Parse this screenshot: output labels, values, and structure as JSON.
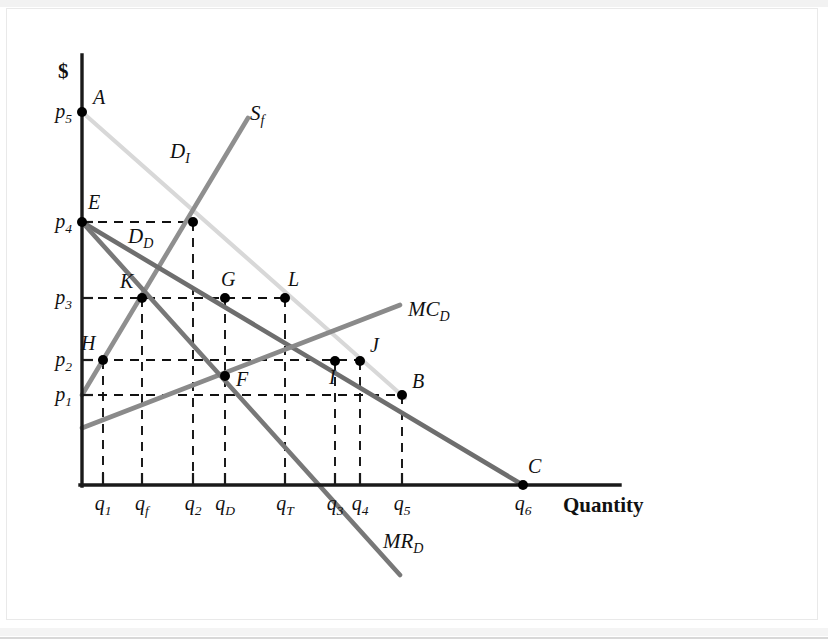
{
  "figure": {
    "title": "",
    "y_axis_label": "$",
    "x_axis_label": "Quantity"
  },
  "chart_data": {
    "type": "line",
    "title": "",
    "xlabel": "Quantity",
    "ylabel": "$",
    "grid": false,
    "legend_position": "inline-curve-labels",
    "axis_ranges": {
      "x_pixel": [
        80,
        620
      ],
      "y_pixel": [
        55,
        485
      ]
    },
    "price_ticks": [
      {
        "name": "p1",
        "label": "p",
        "sub": "1",
        "y": 395
      },
      {
        "name": "p2",
        "label": "p",
        "sub": "2",
        "y": 360
      },
      {
        "name": "p3",
        "label": "p",
        "sub": "3",
        "y": 298
      },
      {
        "name": "p4",
        "label": "p",
        "sub": "4",
        "y": 222
      },
      {
        "name": "p5",
        "label": "p",
        "sub": "5",
        "y": 112
      }
    ],
    "quantity_ticks": [
      {
        "name": "q1",
        "label": "q",
        "sub": "1",
        "x": 103
      },
      {
        "name": "qf",
        "label": "q",
        "sub": "f",
        "x": 142
      },
      {
        "name": "q2",
        "label": "q",
        "sub": "2",
        "x": 193
      },
      {
        "name": "qD",
        "label": "q",
        "sub": "D",
        "x": 225
      },
      {
        "name": "qT",
        "label": "q",
        "sub": "T",
        "x": 285
      },
      {
        "name": "q3",
        "label": "q",
        "sub": "3",
        "x": 335
      },
      {
        "name": "q4",
        "label": "q",
        "sub": "4",
        "x": 360
      },
      {
        "name": "q5",
        "label": "q",
        "sub": "5",
        "x": 402
      },
      {
        "name": "q6",
        "label": "q",
        "sub": "6",
        "x": 523
      }
    ],
    "series": [
      {
        "name": "D_I",
        "label": "D",
        "sublabel": "I",
        "color": "#d8d8d8",
        "description": "Integrated demand curve",
        "points": [
          [
            82,
            112
          ],
          [
            405,
            398
          ]
        ],
        "label_pos": [
          170,
          158
        ]
      },
      {
        "name": "S_f",
        "label": "S",
        "sublabel": "f",
        "color": "#8f8f8f",
        "description": "Fringe supply curve",
        "points": [
          [
            82,
            395
          ],
          [
            248,
            118
          ]
        ],
        "label_pos": [
          250,
          120
        ]
      },
      {
        "name": "D_D",
        "label": "D",
        "sublabel": "D",
        "color": "#6e6e6e",
        "description": "Dominant firm residual demand curve",
        "points": [
          [
            82,
            222
          ],
          [
            523,
            485
          ]
        ],
        "label_pos": [
          128,
          243
        ]
      },
      {
        "name": "MC_D",
        "label": "MC",
        "sublabel": "D",
        "color": "#8a8a8a",
        "description": "Dominant firm marginal cost curve",
        "points": [
          [
            82,
            428
          ],
          [
            400,
            305
          ]
        ],
        "label_pos": [
          408,
          316
        ]
      },
      {
        "name": "MR_D",
        "label": "MR",
        "sublabel": "D",
        "color": "#787878",
        "description": "Dominant firm marginal revenue curve",
        "points": [
          [
            82,
            222
          ],
          [
            400,
            575
          ]
        ],
        "label_pos": [
          383,
          548
        ]
      }
    ],
    "points": [
      {
        "name": "A",
        "label": "A",
        "x": 82,
        "y": 112,
        "label_dx": 11,
        "label_dy": -8
      },
      {
        "name": "E",
        "label": "E",
        "x": 82,
        "y": 222,
        "label_dx": 6,
        "label_dy": -13
      },
      {
        "name": "K",
        "label": "K",
        "x": 142,
        "y": 298,
        "label_dx": -22,
        "label_dy": -10
      },
      {
        "name": "G",
        "label": "G",
        "x": 225,
        "y": 298,
        "label_dx": -4,
        "label_dy": -12
      },
      {
        "name": "L",
        "label": "L",
        "x": 285,
        "y": 298,
        "label_dx": 3,
        "label_dy": -12
      },
      {
        "name": "H",
        "label": "H",
        "x": 103,
        "y": 360,
        "label_dx": -22,
        "label_dy": -10
      },
      {
        "name": "F",
        "label": "F",
        "x": 225,
        "y": 376,
        "label_dx": 11,
        "label_dy": 10
      },
      {
        "name": "I",
        "label": "I",
        "x": 335,
        "y": 361,
        "label_dx": -6,
        "label_dy": 23
      },
      {
        "name": "J",
        "label": "J",
        "x": 360,
        "y": 361,
        "label_dx": 10,
        "label_dy": -9
      },
      {
        "name": "B",
        "label": "B",
        "x": 402,
        "y": 395,
        "label_dx": 10,
        "label_dy": -7
      },
      {
        "name": "C",
        "label": "C",
        "x": 523,
        "y": 485,
        "label_dx": 5,
        "label_dy": -12
      },
      {
        "name": "Q2onSf",
        "label": "",
        "x": 193,
        "y": 222,
        "label_dx": 0,
        "label_dy": 0
      }
    ],
    "guide_lines": [
      {
        "name": "h-p4",
        "type": "horizontal",
        "y": 222,
        "x1": 82,
        "x2": 193
      },
      {
        "name": "h-p3",
        "type": "horizontal",
        "y": 298,
        "x1": 82,
        "x2": 285
      },
      {
        "name": "h-p2",
        "type": "horizontal",
        "y": 360,
        "x1": 82,
        "x2": 360
      },
      {
        "name": "h-p1",
        "type": "horizontal",
        "y": 395,
        "x1": 82,
        "x2": 402
      },
      {
        "name": "v-q1",
        "type": "vertical",
        "x": 103,
        "y1": 360,
        "y2": 485
      },
      {
        "name": "v-qf",
        "type": "vertical",
        "x": 142,
        "y1": 298,
        "y2": 485
      },
      {
        "name": "v-q2",
        "type": "vertical",
        "x": 193,
        "y1": 222,
        "y2": 485
      },
      {
        "name": "v-qD",
        "type": "vertical",
        "x": 225,
        "y1": 298,
        "y2": 485
      },
      {
        "name": "v-qT",
        "type": "vertical",
        "x": 285,
        "y1": 298,
        "y2": 485
      },
      {
        "name": "v-q3",
        "type": "vertical",
        "x": 335,
        "y1": 361,
        "y2": 485
      },
      {
        "name": "v-q4",
        "type": "vertical",
        "x": 360,
        "y1": 361,
        "y2": 485
      },
      {
        "name": "v-q5",
        "type": "vertical",
        "x": 402,
        "y1": 395,
        "y2": 485
      }
    ]
  }
}
